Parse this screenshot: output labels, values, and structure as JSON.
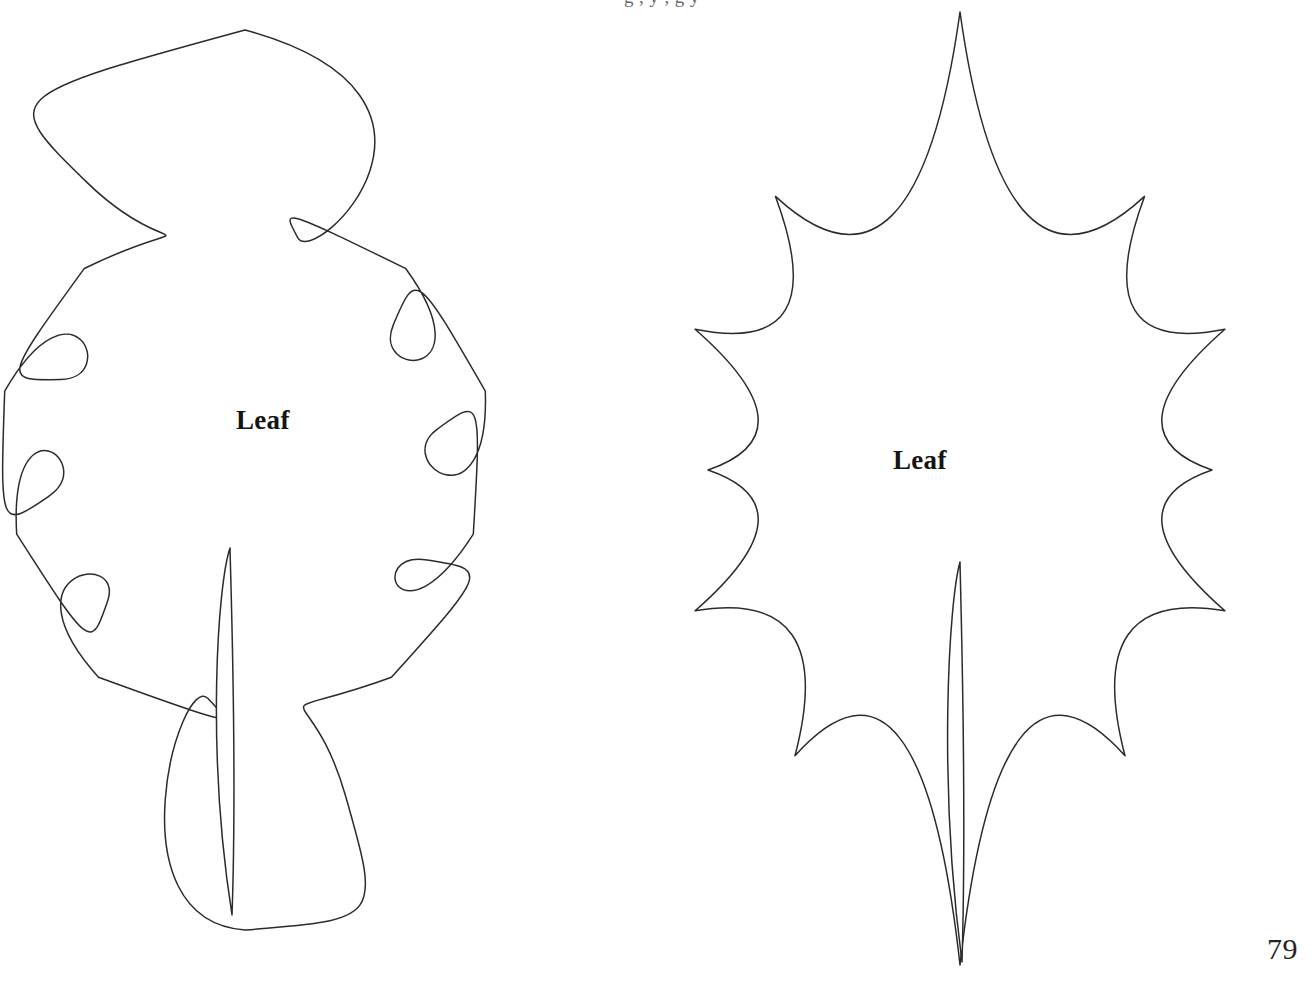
{
  "page": {
    "number": "79",
    "background_color": "#ffffff",
    "ink_color": "#2b2b2b",
    "header_partial_text": "g                   ,          y     ,       g       y"
  },
  "templates": [
    {
      "id": "oak-leaf",
      "label": "Leaf",
      "shape": "oak-leaf-lobed",
      "description": "Rounded multi-lobed oak-style leaf outline with slit stem"
    },
    {
      "id": "holly-leaf",
      "label": "Leaf",
      "shape": "holly-leaf-spiked",
      "description": "Spiked holly leaf outline with pointed tips and slit stem"
    }
  ],
  "artwork": {
    "left_leaf_path": "M 231 38 C 205 39 184 58 176 85 C 168 112 170 147 172 176 C 175 213 180 243 175 267 C 170 290 152 300 135 295 C 115 289 102 272 86 264 C 66 254 44 261 32 281 C 20 300 18 327 22 352 C 28 393 48 437 72 470 C 96 503 118 522 133 544 C 128 538 120 532 110 528 C 92 520 70 521 54 531 C 36 542 28 563 30 586 C 33 621 52 662 78 700 C 110 747 160 805 199 859 C 212 877 222 892 228 900 L 232 913 L 236 900 C 244 873 256 820 266 769 C 274 728 280 690 282 660 C 283 636 282 620 280 608 L 278 548 L 283 556 C 294 574 305 590 316 600 C 332 615 350 618 367 610 C 386 601 401 580 406 556 C 412 528 408 496 396 470 C 387 450 374 430 363 414 L 357 405 L 364 410 C 378 420 394 426 410 424 C 430 421 447 406 457 384 C 469 358 471 324 464 293 C 457 262 441 237 422 222 C 404 208 385 206 371 214 C 362 219 356 227 352 236 L 348 246 L 350 233 C 354 212 362 197 366 184 C 371 168 370 153 363 143 C 355 131 341 127 330 131 C 322 134 317 141 314 149 L 311 157 L 310 142 C 308 116 301 89 288 68 C 274 47 252 37 231 38 Z M 278 548 C 278 548 276 560 274 576 C 270 608 263 664 255 720 C 248 768 241 818 236 852 L 232 880 L 228 852 C 222 812 213 760 205 712 C 197 662 189 608 185 576 C 183 560 182 552 182 552 Z",
    "left_leaf_outer": "M 231 38 C 205 39 184 58 176 85 C 168 112 170 147 172 176 C 175 213 180 243 175 267 C 170 290 152 300 135 295 C 115 289 102 272 86 264 C 66 254 44 261 32 281 C 20 300 18 327 22 352 C 28 393 48 437 72 470 C 96 503 118 522 133 544 C 128 538 120 532 110 528 C 92 520 70 521 54 531 C 36 542 28 563 30 586 C 33 621 52 662 78 700 C 110 747 160 805 199 859 C 212 877 222 892 228 900 L 232 913",
    "right_leaf_path": "M 888 13 L 884 30 C 876 66 858 104 836 131 C 822 148 810 156 802 158 L 792 160 L 801 170 C 820 192 834 216 841 239 C 849 266 846 291 832 305 C 816 321 791 322 776 308 C 764 297 758 280 756 266 L 754 254 L 744 262 C 722 280 694 298 668 314 C 650 325 638 331 632 334 L 624 340 L 634 347 C 652 360 670 378 682 398 C 697 423 702 450 694 472 C 686 495 666 509 646 506 L 636 504 L 636 514 C 637 540 644 570 656 596 C 669 626 686 648 700 658 L 710 666 L 698 670 C 678 677 654 690 632 704 L 622 711 L 632 718 C 652 732 672 752 686 772 C 698 790 704 806 704 818 L 704 828 L 714 824 C 736 816 766 814 794 818 C 824 822 852 834 872 850 C 898 871 926 910 946 946 L 954 962 L 962 946",
    "right_leaf_label_pos": {
      "x": 893,
      "y": 447
    }
  }
}
